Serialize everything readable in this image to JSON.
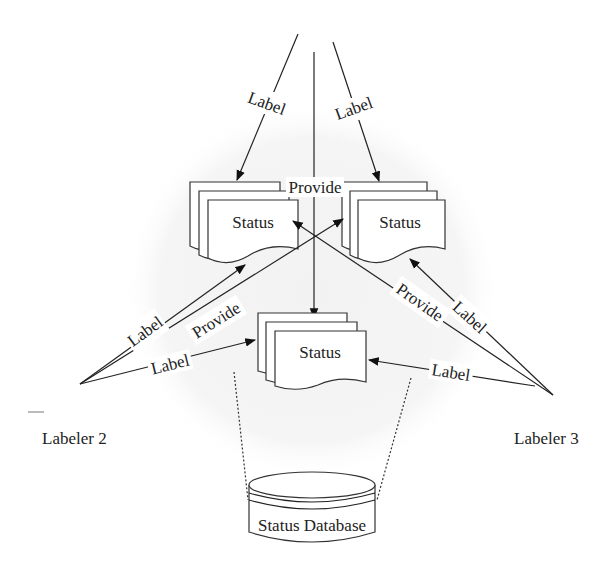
{
  "diagram": {
    "nodes": {
      "status_top_left": {
        "label": "Status"
      },
      "status_top_right": {
        "label": "Status"
      },
      "status_bottom": {
        "label": "Status"
      },
      "database": {
        "label": "Status Database"
      },
      "labeler2": {
        "label": "Labeler 2"
      },
      "labeler3": {
        "label": "Labeler 3"
      }
    },
    "edges": {
      "top_left_label": {
        "label": "Label"
      },
      "top_right_label": {
        "label": "Label"
      },
      "top_provide": {
        "label": "Provide"
      },
      "l2_label_upper": {
        "label": "Label"
      },
      "l2_provide": {
        "label": "Provide"
      },
      "l2_label_lower": {
        "label": "Label"
      },
      "l3_provide": {
        "label": "Provide"
      },
      "l3_label_upper": {
        "label": "Label"
      },
      "l3_label_lower": {
        "label": "Label"
      }
    },
    "colors": {
      "line": "#222222",
      "background_circle": "#f3f3f3"
    }
  }
}
